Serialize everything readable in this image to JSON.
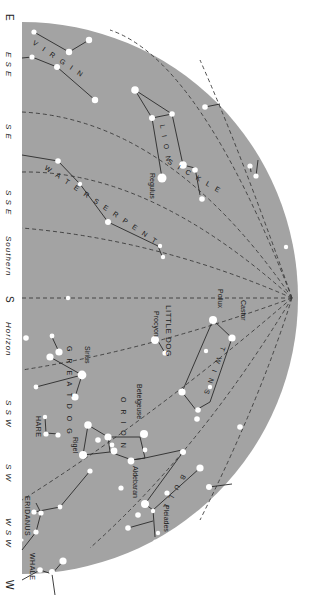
{
  "chart": {
    "type": "star-map",
    "orientation": "rotated-90-clockwise",
    "colors": {
      "sky": "#a3a3a3",
      "background": "#ffffff",
      "stars": "#ffffff",
      "lines": "#2a2a2a"
    }
  },
  "horizon_labels": [
    {
      "id": "e",
      "label": "E",
      "y": 14
    },
    {
      "id": "ese",
      "label": "E S E",
      "y": 60
    },
    {
      "id": "se",
      "label": "S E",
      "y": 130
    },
    {
      "id": "sse",
      "label": "S S E",
      "y": 196
    },
    {
      "id": "southern",
      "label": "Southern",
      "y": 240
    },
    {
      "id": "s",
      "label": "S",
      "y": 301
    },
    {
      "id": "horizon",
      "label": "Horizon",
      "y": 345
    },
    {
      "id": "ssw",
      "label": "S S W",
      "y": 407
    },
    {
      "id": "sw",
      "label": "S W",
      "y": 470
    },
    {
      "id": "wsw",
      "label": "W S W",
      "y": 525
    },
    {
      "id": "w",
      "label": "W",
      "y": 585
    }
  ],
  "constellations": [
    {
      "id": "virgin",
      "label": "V I R G I N"
    },
    {
      "id": "lion",
      "label": "L I O N"
    },
    {
      "id": "sickle",
      "label": "S I C K L E"
    },
    {
      "id": "water-serpent",
      "label": "W A T E R   S E R P E N T"
    },
    {
      "id": "little-dog",
      "label": "LITTLE DOG"
    },
    {
      "id": "twins",
      "label": "T W I N S"
    },
    {
      "id": "great-dog",
      "label": "G R E A T   D O G"
    },
    {
      "id": "orion",
      "label": "O R I O N"
    },
    {
      "id": "hare",
      "label": "HARE"
    },
    {
      "id": "bull",
      "label": "B U L L"
    },
    {
      "id": "eridanus",
      "label": "ERIDANUS"
    },
    {
      "id": "whale",
      "label": "WHALE"
    }
  ],
  "stars": [
    {
      "id": "regulus",
      "label": "Regulus"
    },
    {
      "id": "pollux",
      "label": "Pollux"
    },
    {
      "id": "castor",
      "label": "Castor"
    },
    {
      "id": "procyon",
      "label": "Procyon"
    },
    {
      "id": "sirius",
      "label": "Sirius"
    },
    {
      "id": "betelgeuse",
      "label": "Betelgeuse"
    },
    {
      "id": "rigel",
      "label": "Rigel"
    },
    {
      "id": "aldebaran",
      "label": "Aldebaran"
    },
    {
      "id": "pleiades",
      "label": "Pleiades"
    }
  ]
}
